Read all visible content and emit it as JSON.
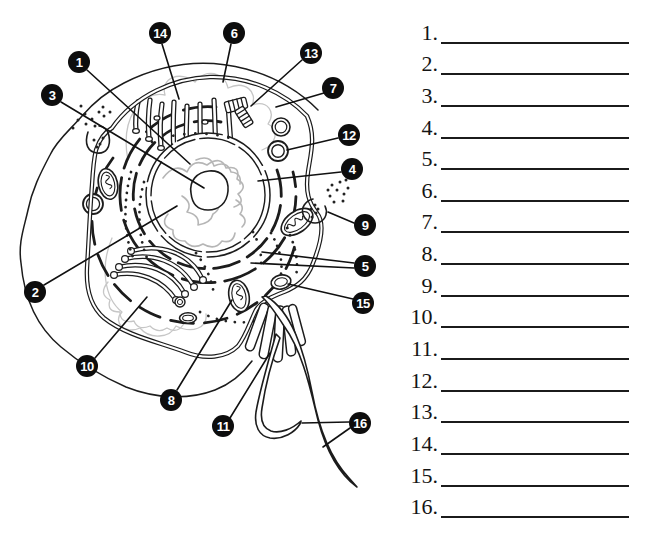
{
  "diagram": {
    "type": "animal-cell-labeling-diagram",
    "colors": {
      "ink": "#1c1c1c",
      "badge_background": "#0d0d0d",
      "badge_number": "#ffffff",
      "chromatin_gray": "#b6b6b6",
      "cytosol_gray": "#c6c6c6"
    },
    "callouts": [
      {
        "label": "1"
      },
      {
        "label": "2"
      },
      {
        "label": "3"
      },
      {
        "label": "4"
      },
      {
        "label": "5"
      },
      {
        "label": "6"
      },
      {
        "label": "7"
      },
      {
        "label": "8"
      },
      {
        "label": "9"
      },
      {
        "label": "10"
      },
      {
        "label": "11"
      },
      {
        "label": "12"
      },
      {
        "label": "13"
      },
      {
        "label": "14"
      },
      {
        "label": "15"
      },
      {
        "label": "16"
      }
    ]
  },
  "answers": {
    "items": [
      {
        "number": "1.",
        "value": ""
      },
      {
        "number": "2.",
        "value": ""
      },
      {
        "number": "3.",
        "value": ""
      },
      {
        "number": "4.",
        "value": ""
      },
      {
        "number": "5.",
        "value": ""
      },
      {
        "number": "6.",
        "value": ""
      },
      {
        "number": "7.",
        "value": ""
      },
      {
        "number": "8.",
        "value": ""
      },
      {
        "number": "9.",
        "value": ""
      },
      {
        "number": "10.",
        "value": ""
      },
      {
        "number": "11.",
        "value": ""
      },
      {
        "number": "12.",
        "value": ""
      },
      {
        "number": "13.",
        "value": ""
      },
      {
        "number": "14.",
        "value": ""
      },
      {
        "number": "15.",
        "value": ""
      },
      {
        "number": "16.",
        "value": ""
      }
    ]
  }
}
